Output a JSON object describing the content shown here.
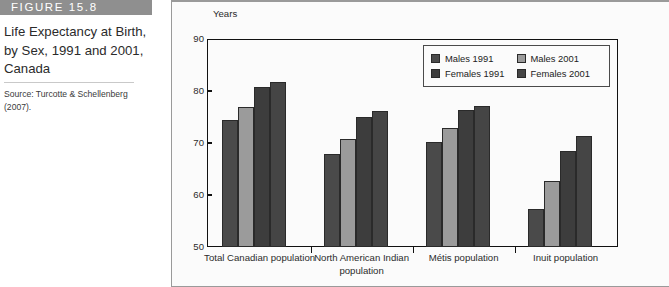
{
  "figure": {
    "header_label": "FIGURE 15.8",
    "title": "Life Expectancy at Birth, by Sex, 1991 and 2001, Canada",
    "source": "Source: Turcotte & Schellenberg (2007)."
  },
  "colors": {
    "header_bar": "#8f8f8f",
    "males_1991": "#4a4a4a",
    "males_2001": "#9b9b9b",
    "females_1991": "#3d3d3d",
    "females_2001": "#454545",
    "panel_background": "#fbfbfb",
    "axis": "#111111"
  },
  "chart_data": {
    "type": "bar",
    "title": "Life Expectancy at Birth, by Sex, 1991 and 2001, Canada",
    "xlabel": "",
    "ylabel": "Years",
    "ylim": [
      50,
      90
    ],
    "yticks": [
      50,
      60,
      70,
      80,
      90
    ],
    "grid": false,
    "legend_position": "top-right",
    "categories": [
      "Total Canadian population",
      "North American Indian population",
      "Métis population",
      "Inuit population"
    ],
    "series": [
      {
        "name": "Males 1991",
        "values": [
          74.6,
          68.0,
          70.3,
          57.3
        ]
      },
      {
        "name": "Males 2001",
        "values": [
          77.1,
          70.9,
          73.0,
          62.7
        ]
      },
      {
        "name": "Females 1991",
        "values": [
          80.9,
          75.1,
          76.5,
          68.5
        ]
      },
      {
        "name": "Females 2001",
        "values": [
          82.0,
          76.4,
          77.3,
          71.4
        ]
      }
    ]
  }
}
